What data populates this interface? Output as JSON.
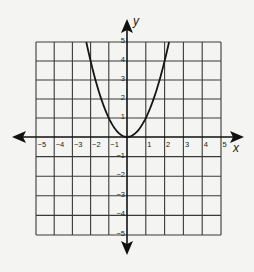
{
  "chart_data": {
    "type": "line",
    "title": "",
    "xlabel": "x",
    "ylabel": "y",
    "xlim": [
      -5,
      5
    ],
    "ylim": [
      -5,
      5
    ],
    "grid": true,
    "x_ticks": [
      "−5",
      "−4",
      "−3",
      "−2",
      "−1",
      "1",
      "2",
      "3",
      "4",
      "5"
    ],
    "y_ticks": [
      "5",
      "4",
      "3",
      "2",
      "1",
      "−1",
      "−2",
      "−3",
      "−4",
      "−5"
    ],
    "series": [
      {
        "name": "y = x^2",
        "equation": "y = x^2",
        "x": [
          -2.236,
          -2,
          -1.5,
          -1,
          -0.5,
          0,
          0.5,
          1,
          1.5,
          2,
          2.236
        ],
        "y": [
          5,
          4,
          2.25,
          1,
          0.25,
          0,
          0.25,
          1,
          2.25,
          4,
          5
        ]
      }
    ],
    "colors": {
      "curve": "#151515",
      "grid": "#3a3a3a",
      "axes": "#111111",
      "background": "#f4f4f2"
    }
  },
  "labels": {
    "x_axis": "x",
    "y_axis": "y"
  }
}
